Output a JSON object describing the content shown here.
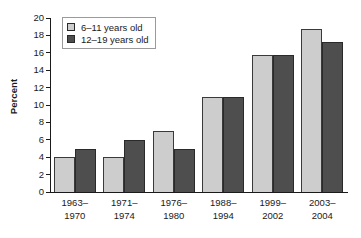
{
  "chart_data": {
    "type": "bar",
    "title": "",
    "subtitle": "",
    "xlabel": "",
    "ylabel": "Percent",
    "ylim": [
      0,
      20
    ],
    "ytick_step": 2,
    "yticks": [
      0,
      2,
      4,
      6,
      8,
      10,
      12,
      14,
      16,
      18,
      20
    ],
    "grid": false,
    "legend_position": "top-left",
    "categories": [
      "1963–\n1970",
      "1971–\n1974",
      "1976–\n1980",
      "1988–\n1994",
      "1999–\n2002",
      "2003–\n2004"
    ],
    "category_lines": [
      [
        "1963–",
        "1970"
      ],
      [
        "1971–",
        "1974"
      ],
      [
        "1976–",
        "1980"
      ],
      [
        "1988–",
        "1994"
      ],
      [
        "1999–",
        "2002"
      ],
      [
        "2003–",
        "2004"
      ]
    ],
    "series": [
      {
        "name": "6–11 years old",
        "color": "#cdcdcd",
        "values": [
          4.0,
          4.0,
          7.0,
          10.9,
          15.8,
          18.7
        ]
      },
      {
        "name": "12–19 years old",
        "color": "#4e4e4e",
        "values": [
          5.0,
          6.0,
          5.0,
          10.9,
          15.8,
          17.3
        ]
      }
    ]
  },
  "legend": {
    "items": [
      {
        "label": "6–11 years old",
        "color": "#cdcdcd"
      },
      {
        "label": "12–19 years old",
        "color": "#4e4e4e"
      }
    ]
  },
  "axes": {
    "y_title": "Percent"
  }
}
